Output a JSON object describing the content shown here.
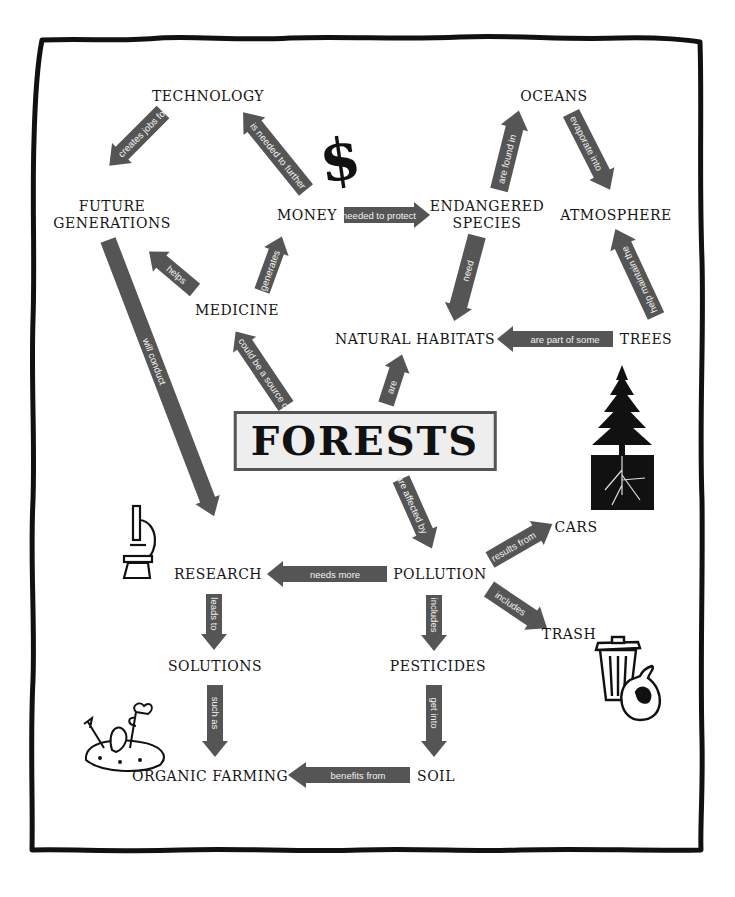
{
  "diagram": {
    "type": "concept-map",
    "central_concept": "FORESTS",
    "colors": {
      "arrow": "#555555",
      "arrow_text": "#f3f3f3",
      "frame": "#111111",
      "central_box_bg": "#eeeeee",
      "central_box_border": "#555555"
    },
    "nodes": {
      "technology": "TECHNOLOGY",
      "oceans": "OCEANS",
      "future_generations_1": "FUTURE",
      "future_generations_2": "GENERATIONS",
      "money": "MONEY",
      "endangered_species_1": "ENDANGERED",
      "endangered_species_2": "SPECIES",
      "atmosphere": "ATMOSPHERE",
      "medicine": "MEDICINE",
      "natural_habitats": "NATURAL HABITATS",
      "trees": "TREES",
      "forests": "FORESTS",
      "cars": "CARS",
      "research": "RESEARCH",
      "pollution": "POLLUTION",
      "trash": "TRASH",
      "solutions": "SOLUTIONS",
      "pesticides": "PESTICIDES",
      "organic_farming": "ORGANIC FARMING",
      "soil": "SOIL"
    },
    "edges": [
      {
        "from": "TECHNOLOGY",
        "to": "FUTURE GENERATIONS",
        "label": "creates jobs for"
      },
      {
        "from": "MONEY",
        "to": "TECHNOLOGY",
        "label": "is needed to further"
      },
      {
        "from": "MONEY",
        "to": "ENDANGERED SPECIES",
        "label": "needed to protect"
      },
      {
        "from": "ENDANGERED SPECIES",
        "to": "OCEANS",
        "label": "are found in"
      },
      {
        "from": "OCEANS",
        "to": "ATMOSPHERE",
        "label": "evaporate into"
      },
      {
        "from": "TREES",
        "to": "ATMOSPHERE",
        "label": "help maintain the"
      },
      {
        "from": "ENDANGERED SPECIES",
        "to": "NATURAL HABITATS",
        "label": "need"
      },
      {
        "from": "TREES",
        "to": "NATURAL HABITATS",
        "label": "are part of some"
      },
      {
        "from": "MEDICINE",
        "to": "FUTURE GENERATIONS",
        "label": "helps"
      },
      {
        "from": "MEDICINE",
        "to": "MONEY",
        "label": "generates"
      },
      {
        "from": "FORESTS",
        "to": "MEDICINE",
        "label": "could be a source of"
      },
      {
        "from": "FORESTS",
        "to": "NATURAL HABITATS",
        "label": "are"
      },
      {
        "from": "FUTURE GENERATIONS",
        "to": "RESEARCH",
        "label": "will conduct"
      },
      {
        "from": "FORESTS",
        "to": "POLLUTION",
        "label": "are affected by"
      },
      {
        "from": "POLLUTION",
        "to": "CARS",
        "label": "results from"
      },
      {
        "from": "POLLUTION",
        "to": "TRASH",
        "label": "includes"
      },
      {
        "from": "POLLUTION",
        "to": "RESEARCH",
        "label": "needs more"
      },
      {
        "from": "POLLUTION",
        "to": "PESTICIDES",
        "label": "includes"
      },
      {
        "from": "RESEARCH",
        "to": "SOLUTIONS",
        "label": "leads to"
      },
      {
        "from": "SOLUTIONS",
        "to": "ORGANIC FARMING",
        "label": "such as"
      },
      {
        "from": "PESTICIDES",
        "to": "SOIL",
        "label": "get into"
      },
      {
        "from": "SOIL",
        "to": "ORGANIC FARMING",
        "label": "benefits from"
      }
    ],
    "illustrations": [
      "dollar-sign",
      "pine-tree-with-roots",
      "microscope",
      "trash-can-and-bag",
      "trowel-and-seedlings"
    ]
  },
  "labels": {
    "creates_jobs_for": "creates jobs for",
    "is_needed_to_further": "is needed to further",
    "needed_to_protect": "needed to protect",
    "are_found_in": "are found in",
    "evaporate_into": "evaporate into",
    "help_maintain_the": "help maintain the",
    "need": "need",
    "are_part_of_some": "are part of some",
    "helps": "helps",
    "generates": "generates",
    "could_be_a_source_of": "could be a source of",
    "are": "are",
    "will_conduct": "will conduct",
    "are_affected_by": "are affected by",
    "results_from": "results from",
    "includes_trash": "includes",
    "needs_more": "needs more",
    "includes_pesticides": "includes",
    "leads_to": "leads to",
    "such_as": "such as",
    "get_into": "get into",
    "benefits_from": "benefits from",
    "dollar": "$"
  }
}
